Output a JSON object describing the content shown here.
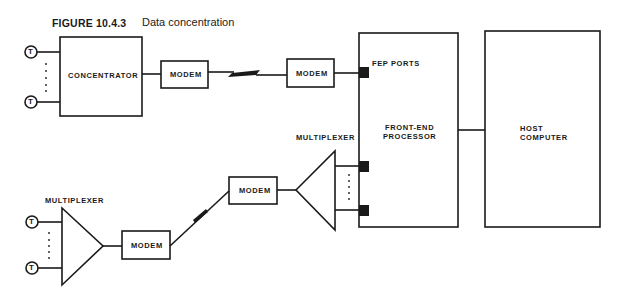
{
  "figure": {
    "number": "FIGURE 10.4.3",
    "title": "Data concentration"
  },
  "nodes": {
    "concentrator": "CONCENTRATOR",
    "modem_top_left": "MODEM",
    "modem_top_right": "MODEM",
    "modem_bottom_left": "MODEM",
    "modem_bottom_right": "MODEM",
    "mux_left": "MULTIPLEXER",
    "mux_right": "MULTIPLEXER",
    "fep_ports": "FEP PORTS",
    "fep_line1": "FRONT-END",
    "fep_line2": "PROCESSOR",
    "host_line1": "HOST",
    "host_line2": "COMPUTER",
    "terminal": "T"
  },
  "colors": {
    "stroke": "#1a1a1a",
    "background": "#ffffff"
  }
}
